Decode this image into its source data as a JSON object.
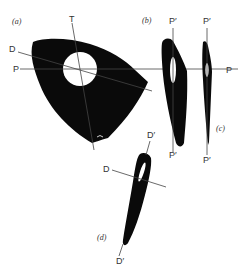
{
  "colors": {
    "shape": "#0a0a0a",
    "line": "#444444",
    "background": "#ffffff",
    "text": "#333333"
  },
  "panels": {
    "a": {
      "label": "(a)",
      "axes": {
        "T": "T",
        "D": "D",
        "P": "P"
      }
    },
    "b": {
      "label": "(b)",
      "axes": {
        "top": "P′",
        "bottom": "P′"
      }
    },
    "c": {
      "label": "(c)",
      "axes": {
        "top": "P′",
        "bottom": "P′",
        "right": "P"
      }
    },
    "d": {
      "label": "(d)",
      "axes": {
        "top": "D′",
        "bottom": "D′",
        "left": "D"
      }
    }
  }
}
